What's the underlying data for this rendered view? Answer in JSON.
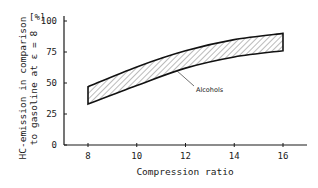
{
  "chart_data": {
    "type": "area",
    "title": "",
    "xlabel": "Compression ratio",
    "ylabel_line1": "HC-emission in comparison",
    "ylabel_line2": "to gasoline at ε = 8",
    "yunit": "[%]",
    "xlim": [
      8,
      16
    ],
    "ylim": [
      0,
      100
    ],
    "x_ticks": [
      8,
      10,
      12,
      14,
      16
    ],
    "y_ticks": [
      0,
      25,
      50,
      75,
      100
    ],
    "grid": false,
    "x": [
      8,
      10,
      12,
      14,
      16
    ],
    "series": [
      {
        "name": "Alcohols upper bound",
        "values": [
          47,
          63,
          76,
          85,
          90
        ]
      },
      {
        "name": "Alcohols lower bound",
        "values": [
          33,
          48,
          62,
          71,
          76
        ]
      }
    ],
    "annotations": [
      {
        "text": "Alcohols",
        "target_x": 11.6,
        "target_y": 60
      }
    ],
    "fill_pattern": "diagonal hatch"
  }
}
